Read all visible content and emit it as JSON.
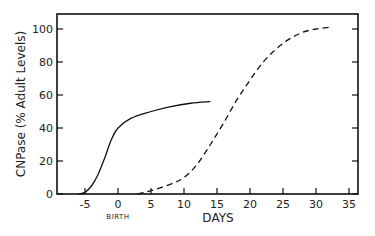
{
  "chart_data": {
    "type": "line",
    "title": "",
    "xlabel": "DAYS",
    "ylabel": "CNPase  (% Adult Levels)",
    "x_annotation": "BIRTH",
    "xlim": [
      -8,
      36
    ],
    "ylim": [
      0,
      110
    ],
    "xticks": [
      -5,
      0,
      5,
      10,
      15,
      20,
      25,
      30,
      35
    ],
    "yticks": [
      0,
      20,
      40,
      60,
      80,
      100
    ],
    "grid": false,
    "legend": "none",
    "series": [
      {
        "name": "solid",
        "style": "solid",
        "x": [
          -6,
          -5,
          -4,
          -3,
          -2,
          -1,
          0,
          2,
          5,
          8,
          11,
          14
        ],
        "y": [
          0,
          1,
          5,
          12,
          22,
          33,
          40,
          46,
          50,
          53,
          55,
          56
        ]
      },
      {
        "name": "dashed",
        "style": "dashed",
        "x": [
          3,
          5,
          8,
          10,
          12,
          14,
          16,
          18,
          20,
          22,
          24,
          26,
          28,
          30,
          32
        ],
        "y": [
          0,
          2,
          6,
          10,
          18,
          30,
          43,
          57,
          69,
          80,
          88,
          94,
          98,
          100,
          101
        ]
      }
    ]
  }
}
